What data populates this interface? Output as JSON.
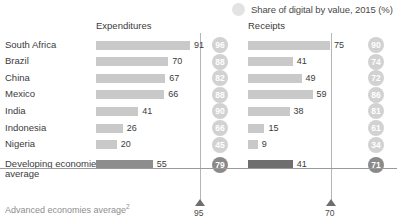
{
  "legend": {
    "icon": "circle-swatch",
    "text": "Share of digital by value, 2015 (%)"
  },
  "headers": {
    "expenditures": "Expenditures",
    "receipts": "Receipts"
  },
  "footer": {
    "label": "Advanced economies average",
    "label_superscript": "2",
    "expenditures_marker": "95",
    "receipts_marker": "70"
  },
  "chart_data": {
    "type": "bar",
    "title": "",
    "subtitle": "",
    "xlabel": "",
    "ylabel": "",
    "legend_entries": [
      "Share of digital by value, 2015 (%)"
    ],
    "legend_position": "top-right",
    "grid": false,
    "xlim": [
      0,
      100
    ],
    "categories": [
      "South Africa",
      "Brazil",
      "China",
      "Mexico",
      "India",
      "Indonesia",
      "Nigeria",
      "Developing economies average"
    ],
    "series": [
      {
        "name": "Expenditures",
        "values": [
          91,
          70,
          67,
          66,
          41,
          26,
          20,
          55
        ]
      },
      {
        "name": "Receipts",
        "values": [
          75,
          41,
          49,
          59,
          38,
          15,
          9,
          41
        ]
      },
      {
        "name": "Share of digital by value, 2015 (%) — Expenditures",
        "values": [
          96,
          88,
          82,
          88,
          90,
          66,
          45,
          79
        ]
      },
      {
        "name": "Share of digital by value, 2015 (%) — Receipts",
        "values": [
          90,
          74,
          72,
          86,
          81,
          61,
          34,
          71
        ]
      }
    ],
    "annotations": [
      {
        "label": "Advanced economies average",
        "series": "Expenditures",
        "value": 95
      },
      {
        "label": "Advanced economies average",
        "series": "Receipts",
        "value": 70
      }
    ]
  },
  "rows": [
    {
      "label": "South Africa",
      "exp": 91,
      "rec": 75,
      "exp_share": 96,
      "rec_share": 90
    },
    {
      "label": "Brazil",
      "exp": 70,
      "rec": 41,
      "exp_share": 88,
      "rec_share": 74
    },
    {
      "label": "China",
      "exp": 67,
      "rec": 49,
      "exp_share": 82,
      "rec_share": 72
    },
    {
      "label": "Mexico",
      "exp": 66,
      "rec": 59,
      "exp_share": 88,
      "rec_share": 86
    },
    {
      "label": "India",
      "exp": 41,
      "rec": 38,
      "exp_share": 90,
      "rec_share": 81
    },
    {
      "label": "Indonesia",
      "exp": 26,
      "rec": 15,
      "exp_share": 66,
      "rec_share": 61
    },
    {
      "label": "Nigeria",
      "exp": 20,
      "rec": 9,
      "exp_share": 45,
      "rec_share": 34
    },
    {
      "label": "Developing economies average",
      "label_line1": "Developing economies",
      "label_line2": "average",
      "exp": 55,
      "rec": 41,
      "exp_share": 79,
      "rec_share": 71
    }
  ],
  "colors": {
    "bar": "#c9c9c9",
    "bar_total": "#8d8d8d",
    "bar_total_receipts": "#6e6e6e",
    "circle": "#d2d2d2",
    "circle_total": "#8a8a8a",
    "marker": "#6e6e6e",
    "refline": "#b5b5b5",
    "text": "#3b3b3b",
    "muted_text": "#8e8e8e"
  }
}
